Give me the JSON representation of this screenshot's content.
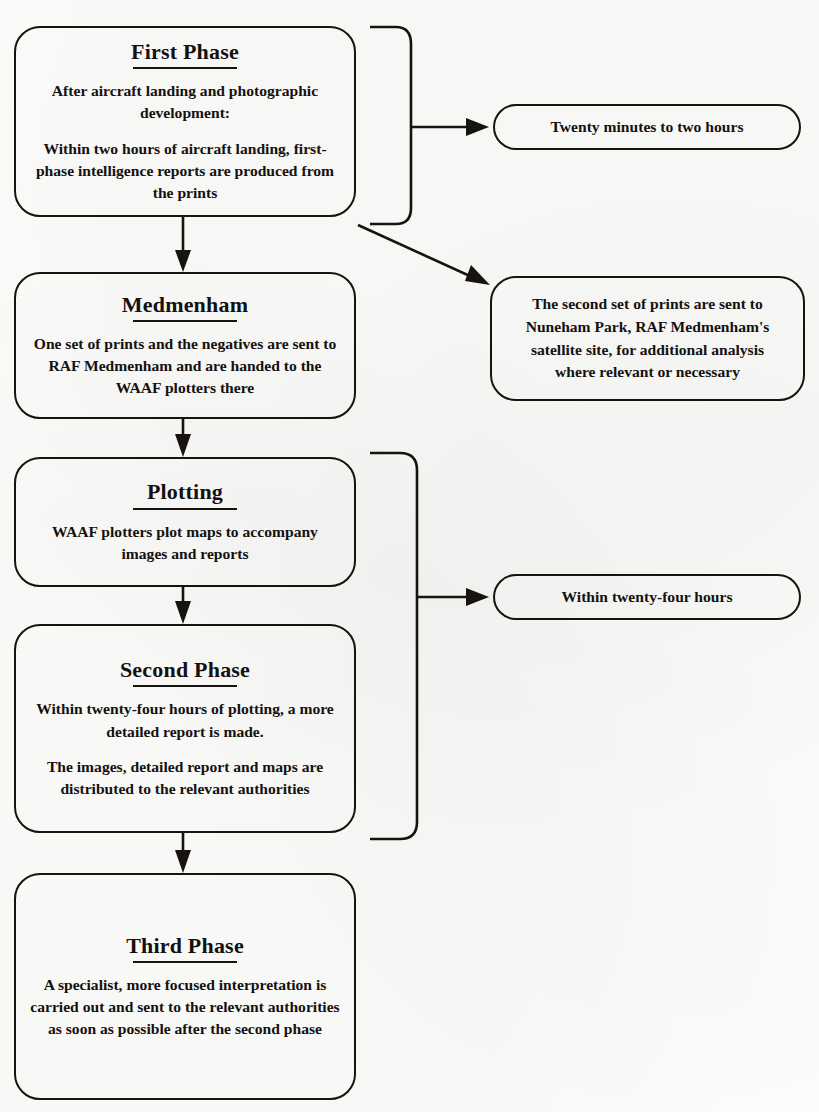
{
  "diagram": {
    "type": "flowchart",
    "orientation": "vertical-with-side-callouts",
    "background_color": "#fcfcfb",
    "line_color": "#17130f",
    "nodes": [
      {
        "id": "first-phase",
        "title": "First Phase",
        "paragraphs": [
          "After aircraft landing and photographic development:",
          "Within two hours of aircraft landing, first-phase intelligence reports are produced from the prints"
        ]
      },
      {
        "id": "medmenham",
        "title": "Medmenham",
        "paragraphs": [
          "One set of prints and the negatives are sent to RAF Medmenham and are handed to the WAAF plotters there"
        ]
      },
      {
        "id": "plotting",
        "title": "Plotting",
        "paragraphs": [
          "WAAF plotters plot maps to accompany images and reports"
        ]
      },
      {
        "id": "second-phase",
        "title": "Second Phase",
        "paragraphs": [
          "Within twenty-four hours of plotting, a more detailed report is made.",
          "The images, detailed report and maps are distributed to the relevant authorities"
        ]
      },
      {
        "id": "third-phase",
        "title": "Third Phase",
        "paragraphs": [
          "A specialist, more focused interpretation is carried out and sent to the relevant authorities as soon as possible after the second phase"
        ]
      }
    ],
    "callouts": [
      {
        "id": "timing-first-phase",
        "shape": "pill",
        "text": "Twenty minutes to two hours"
      },
      {
        "id": "nuneham-park",
        "shape": "rounded-rect",
        "text": "The second set of prints are sent to Nuneham Park, RAF Medmenham's satellite site, for additional analysis where relevant or necessary"
      },
      {
        "id": "timing-second-phase",
        "shape": "pill",
        "text": "Within twenty-four hours"
      }
    ],
    "edges": [
      {
        "id": "first-to-medmenham",
        "from": "first-phase",
        "to": "medmenham",
        "style": "arrow-down"
      },
      {
        "id": "medmenham-to-plotting",
        "from": "medmenham",
        "to": "plotting",
        "style": "arrow-down"
      },
      {
        "id": "plotting-to-second",
        "from": "plotting",
        "to": "second-phase",
        "style": "arrow-down"
      },
      {
        "id": "second-to-third",
        "from": "second-phase",
        "to": "third-phase",
        "style": "arrow-down"
      },
      {
        "id": "first-brace-to-timing",
        "from": "first-phase",
        "to": "timing-first-phase",
        "style": "brace-then-arrow-right"
      },
      {
        "id": "first-to-nuneham",
        "from": "first-phase",
        "to": "nuneham-park",
        "style": "diagonal-arrow"
      },
      {
        "id": "plotting-second-brace-to-timing",
        "from": "plotting+second-phase",
        "to": "timing-second-phase",
        "style": "brace-then-arrow-right"
      }
    ]
  }
}
